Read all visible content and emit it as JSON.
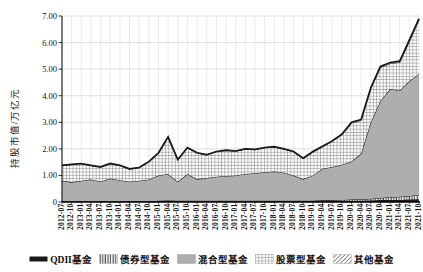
{
  "chart_data": {
    "type": "area",
    "stacked": true,
    "title": "",
    "xlabel": "",
    "ylabel": "持股市值/万亿元",
    "ylim": [
      0,
      7
    ],
    "ytick_labels": [
      "0",
      "1.00",
      "2.00",
      "3.00",
      "4.00",
      "5.00",
      "6.00",
      "7.00"
    ],
    "grid": true,
    "legend_position": "bottom",
    "categories": [
      "2012-07",
      "2012-10",
      "2013-01",
      "2013-04",
      "2013-07",
      "2013-10",
      "2014-01",
      "2014-04",
      "2014-07",
      "2014-10",
      "2015-01",
      "2015-04",
      "2015-07",
      "2015-10",
      "2016-01",
      "2016-04",
      "2016-07",
      "2016-10",
      "2017-01",
      "2017-04",
      "2017-07",
      "2017-10",
      "2018-01",
      "2018-04",
      "2018-07",
      "2018-10",
      "2019-01",
      "2019-04",
      "2019-07",
      "2019-10",
      "2020-01",
      "2020-04",
      "2020-07",
      "2020-10",
      "2021-01",
      "2021-04",
      "2021-07",
      "2021-10"
    ],
    "series": [
      {
        "name": "QDII基金",
        "pattern": "solid-black",
        "values": [
          0.02,
          0.02,
          0.02,
          0.02,
          0.02,
          0.02,
          0.02,
          0.02,
          0.02,
          0.02,
          0.03,
          0.04,
          0.03,
          0.03,
          0.03,
          0.03,
          0.03,
          0.03,
          0.03,
          0.03,
          0.03,
          0.03,
          0.03,
          0.03,
          0.03,
          0.03,
          0.03,
          0.04,
          0.04,
          0.04,
          0.05,
          0.05,
          0.06,
          0.07,
          0.08,
          0.08,
          0.09,
          0.1
        ]
      },
      {
        "name": "债券型基金",
        "pattern": "vertical-lines",
        "values": [
          0.01,
          0.01,
          0.01,
          0.01,
          0.01,
          0.01,
          0.01,
          0.01,
          0.01,
          0.01,
          0.02,
          0.02,
          0.02,
          0.02,
          0.02,
          0.02,
          0.02,
          0.02,
          0.02,
          0.02,
          0.02,
          0.02,
          0.02,
          0.02,
          0.02,
          0.02,
          0.02,
          0.03,
          0.03,
          0.04,
          0.04,
          0.05,
          0.06,
          0.08,
          0.1,
          0.12,
          0.14,
          0.16
        ]
      },
      {
        "name": "混合型基金",
        "pattern": "solid-gray",
        "values": [
          0.77,
          0.72,
          0.77,
          0.82,
          0.74,
          0.85,
          0.79,
          0.73,
          0.77,
          0.82,
          0.95,
          0.99,
          0.71,
          1.0,
          0.81,
          0.85,
          0.9,
          0.93,
          0.95,
          1.0,
          1.03,
          1.07,
          1.1,
          1.05,
          0.95,
          0.81,
          0.95,
          1.18,
          1.25,
          1.32,
          1.43,
          1.72,
          2.88,
          3.65,
          4.07,
          4.0,
          4.32,
          4.56
        ]
      },
      {
        "name": "股票型基金",
        "pattern": "crosshatch",
        "values": [
          0.57,
          0.66,
          0.64,
          0.52,
          0.54,
          0.56,
          0.55,
          0.48,
          0.49,
          0.66,
          0.84,
          1.39,
          0.83,
          0.99,
          0.98,
          0.87,
          0.94,
          0.96,
          0.91,
          0.94,
          0.89,
          0.92,
          0.92,
          0.89,
          0.89,
          0.78,
          0.88,
          0.83,
          0.96,
          1.13,
          1.45,
          1.25,
          1.27,
          1.26,
          0.96,
          1.06,
          1.5,
          2.03
        ]
      },
      {
        "name": "其他基金",
        "pattern": "diagonal-lines",
        "values": [
          0.01,
          0.01,
          0.01,
          0.01,
          0.01,
          0.01,
          0.01,
          0.01,
          0.01,
          0.01,
          0.01,
          0.01,
          0.01,
          0.01,
          0.01,
          0.01,
          0.01,
          0.01,
          0.01,
          0.01,
          0.01,
          0.01,
          0.01,
          0.01,
          0.01,
          0.01,
          0.02,
          0.02,
          0.02,
          0.02,
          0.03,
          0.03,
          0.03,
          0.04,
          0.04,
          0.04,
          0.05,
          0.05
        ]
      }
    ],
    "colors": {
      "line_black": "#1a1a1a",
      "area_gray": "#aeaeae",
      "grid": "#c9c9c9",
      "axis": "#000000"
    }
  }
}
